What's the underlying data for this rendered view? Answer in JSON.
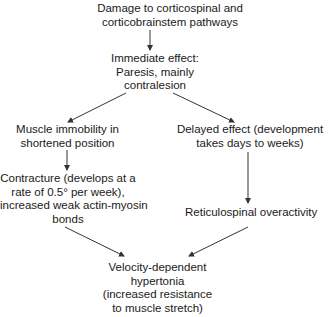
{
  "diagram": {
    "type": "flowchart",
    "nodes": [
      {
        "id": "damage",
        "lines": [
          "Damage to corticospinal and",
          "corticobrainstem pathways"
        ]
      },
      {
        "id": "immediate",
        "lines": [
          "Immediate effect:",
          "Paresis, mainly",
          "contralesion"
        ]
      },
      {
        "id": "immobility",
        "lines": [
          "Muscle immobility in",
          "shortened position"
        ]
      },
      {
        "id": "delayed",
        "lines": [
          "Delayed effect (development",
          "takes days to weeks)"
        ]
      },
      {
        "id": "contracture",
        "lines": [
          "Contracture (develops at a",
          "rate of 0.5° per week),",
          "increased weak actin-myosin",
          "bonds"
        ]
      },
      {
        "id": "reticulospinal",
        "lines": [
          "Reticulospinal overactivity"
        ]
      },
      {
        "id": "hypertonia",
        "lines": [
          "Velocity-dependent",
          "hypertonia",
          "(increased resistance",
          "to muscle stretch)"
        ]
      }
    ],
    "edges": [
      {
        "from": "damage",
        "to": "immediate"
      },
      {
        "from": "immediate",
        "to": "immobility"
      },
      {
        "from": "immediate",
        "to": "delayed"
      },
      {
        "from": "immobility",
        "to": "contracture"
      },
      {
        "from": "delayed",
        "to": "reticulospinal"
      },
      {
        "from": "contracture",
        "to": "hypertonia"
      },
      {
        "from": "reticulospinal",
        "to": "hypertonia"
      }
    ],
    "colors": {
      "text": "#1a1a1a",
      "arrow": "#333333",
      "background": "#ffffff"
    }
  }
}
